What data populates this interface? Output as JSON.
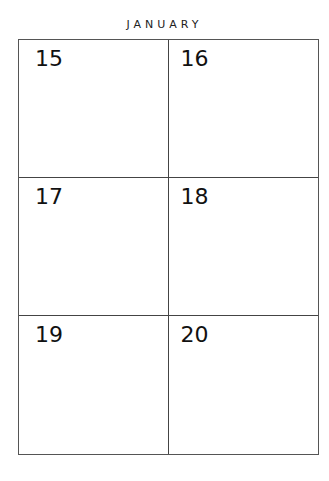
{
  "month": "JANUARY",
  "days": [
    {
      "label": "15"
    },
    {
      "label": "16"
    },
    {
      "label": "17"
    },
    {
      "label": "18"
    },
    {
      "label": "19"
    },
    {
      "label": "20"
    }
  ]
}
